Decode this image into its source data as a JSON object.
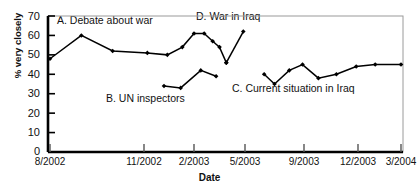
{
  "chart_data": {
    "type": "line",
    "title": "",
    "xlabel": "Date",
    "ylabel": "% very closely",
    "ylim": [
      0,
      70
    ],
    "yticks": [
      0,
      10,
      20,
      30,
      40,
      50,
      60,
      70
    ],
    "xticks": [
      "8/2002",
      "11/2002",
      "2/2003",
      "5/2003",
      "9/2003",
      "12/2003",
      "3/2004"
    ],
    "grid": false,
    "legend_position": "inline-annotations",
    "marker": "filled-diamond",
    "line_color": "#000000",
    "series": [
      {
        "name": "A. Debate about war",
        "label": "A. Debate about war",
        "x": [
          "8/2002",
          "9/2002",
          "10/2002",
          "11/2002",
          "12/2002",
          "1/2003",
          "2/2003",
          "2/2003b",
          "3/2003",
          "3/2003b",
          "3/2003c"
        ],
        "values": [
          48,
          60,
          52,
          51,
          50,
          54,
          61,
          61,
          57,
          54,
          46
        ]
      },
      {
        "name": "B. UN inspectors",
        "label": "B. UN inspectors",
        "x": [
          "12/2002",
          "1/2003",
          "2/2003",
          "3/2003"
        ],
        "values": [
          34,
          33,
          42,
          39
        ]
      },
      {
        "name": "D. War in Iraq",
        "label": "D. War in Iraq",
        "x": [
          "3/2003",
          "4/2003"
        ],
        "values": [
          46,
          62
        ]
      },
      {
        "name": "C. Current situation in Iraq",
        "label": "C. Current situation in Iraq",
        "x": [
          "6/2003",
          "7/2003",
          "8/2003",
          "9/2003",
          "10/2003",
          "11/2003",
          "12/2003",
          "1/2004",
          "3/2004"
        ],
        "values": [
          40,
          35,
          42,
          45,
          38,
          40,
          44,
          45,
          45
        ]
      }
    ],
    "annotations": [
      {
        "text": "A. Debate about war",
        "x_px": 57,
        "y_px": 14
      },
      {
        "text": "B. UN inspectors",
        "x_px": 106,
        "y_px": 92
      },
      {
        "text": "D. War in Iraq",
        "x_px": 196,
        "y_px": 10
      },
      {
        "text": "C. Current situation in Iraq",
        "x_px": 232,
        "y_px": 82
      }
    ]
  }
}
